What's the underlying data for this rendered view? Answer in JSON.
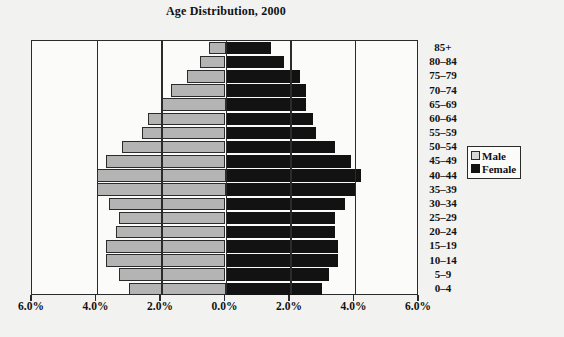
{
  "chart_data": {
    "type": "bar",
    "title": "Age Distribution, 2000",
    "subtitle": "",
    "xlabel": "",
    "ylabel": "",
    "orientation": "population-pyramid",
    "xlim": [
      -6,
      6
    ],
    "grid": true,
    "legend_position": "right",
    "axis_ticks": [
      {
        "label": "6.0%",
        "value": -6
      },
      {
        "label": "4.0%",
        "value": -4
      },
      {
        "label": "2.0%",
        "value": -2
      },
      {
        "label": "0.0%",
        "value": 0
      },
      {
        "label": "2.0%",
        "value": 2
      },
      {
        "label": "4.0%",
        "value": 4
      },
      {
        "label": "6.0%",
        "value": 6
      }
    ],
    "categories": [
      "85+",
      "80–84",
      "75–79",
      "70–74",
      "65–69",
      "60–64",
      "55–59",
      "50–54",
      "45–49",
      "40–44",
      "35–39",
      "30–34",
      "25–29",
      "20–24",
      "15–19",
      "10–14",
      "5–9",
      "0–4"
    ],
    "series": [
      {
        "name": "Male",
        "color": "#b4b4b4",
        "values": [
          0.5,
          0.8,
          1.2,
          1.7,
          2.0,
          2.4,
          2.6,
          3.2,
          3.7,
          4.0,
          4.0,
          3.6,
          3.3,
          3.4,
          3.7,
          3.7,
          3.3,
          3.0
        ]
      },
      {
        "name": "Female",
        "color": "#121212",
        "values": [
          1.4,
          1.8,
          2.3,
          2.5,
          2.5,
          2.7,
          2.8,
          3.4,
          3.9,
          4.2,
          4.0,
          3.7,
          3.4,
          3.4,
          3.5,
          3.5,
          3.2,
          3.0
        ]
      }
    ]
  },
  "legend": {
    "items": [
      {
        "label": "Male"
      },
      {
        "label": "Female"
      }
    ]
  }
}
